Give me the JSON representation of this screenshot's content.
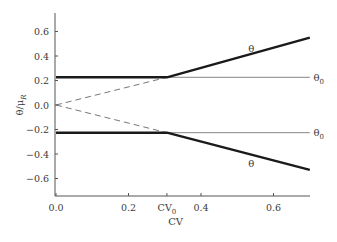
{
  "chart_data": {
    "type": "line",
    "title": "",
    "xlabel": "CV",
    "ylabel": "θ/μR",
    "ylabel_main": "θ/μ",
    "ylabel_sub": "R",
    "xlim": [
      0.0,
      0.7
    ],
    "ylim": [
      -0.75,
      0.75
    ],
    "grid": false,
    "legend": "none",
    "x_ticks": [
      {
        "value": 0.0,
        "label": "0.0"
      },
      {
        "value": 0.2,
        "label": "0.2"
      },
      {
        "value": 0.306,
        "label": "CV",
        "sub": "0"
      },
      {
        "value": 0.4,
        "label": "0.4"
      },
      {
        "value": 0.6,
        "label": "0.6"
      }
    ],
    "y_ticks": [
      {
        "value": 0.6,
        "label": "0.6"
      },
      {
        "value": 0.4,
        "label": "0.4"
      },
      {
        "value": 0.2,
        "label": "0.2"
      },
      {
        "value": 0.0,
        "label": "0.0"
      },
      {
        "value": -0.2,
        "label": "-0.2"
      },
      {
        "value": -0.4,
        "label": "-0.4"
      },
      {
        "value": -0.6,
        "label": "-0.6"
      }
    ],
    "series": [
      {
        "name": "θ (upper)",
        "style": "thick-solid",
        "x": [
          0.0,
          0.306,
          0.7
        ],
        "y": [
          0.226,
          0.226,
          0.55
        ]
      },
      {
        "name": "θ (lower)",
        "style": "thick-solid",
        "x": [
          0.0,
          0.306,
          0.7
        ],
        "y": [
          -0.226,
          -0.226,
          -0.53
        ]
      },
      {
        "name": "θ0 (upper)",
        "style": "thin-solid",
        "x": [
          0.306,
          0.7
        ],
        "y": [
          0.226,
          0.226
        ]
      },
      {
        "name": "θ0 (lower)",
        "style": "thin-solid",
        "x": [
          0.306,
          0.7
        ],
        "y": [
          -0.226,
          -0.226
        ]
      },
      {
        "name": "θ0 ramp (upper)",
        "style": "dashed",
        "x": [
          0.0,
          0.306
        ],
        "y": [
          0.0,
          0.226
        ]
      },
      {
        "name": "θ0 ramp (lower)",
        "style": "dashed",
        "x": [
          0.0,
          0.306
        ],
        "y": [
          0.0,
          -0.226
        ]
      }
    ],
    "annotations": [
      {
        "text": "θ",
        "x": 0.53,
        "y": 0.46,
        "name": "theta-upper-label"
      },
      {
        "text": "θ",
        "sub": "0",
        "x": 0.71,
        "y": 0.22,
        "name": "theta0-upper-label"
      },
      {
        "text": "θ",
        "sub": "0",
        "x": 0.71,
        "y": -0.23,
        "name": "theta0-lower-label"
      },
      {
        "text": "θ",
        "x": 0.53,
        "y": -0.48,
        "name": "theta-lower-label"
      }
    ]
  },
  "labels": {
    "theta": "θ",
    "theta0": "θ",
    "sub0": "0",
    "cv0": "CV",
    "cv0_sub": "0"
  }
}
